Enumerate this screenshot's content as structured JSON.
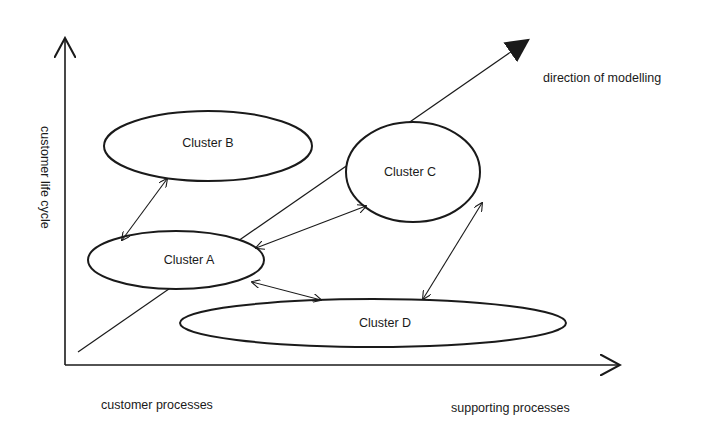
{
  "diagram": {
    "axes": {
      "y_label": "customer life cycle",
      "x_label_left": "customer processes",
      "x_label_right": "supporting processes"
    },
    "direction_label": "direction of modelling",
    "clusters": [
      {
        "id": "A",
        "label": "Cluster A"
      },
      {
        "id": "B",
        "label": "Cluster B"
      },
      {
        "id": "C",
        "label": "Cluster C"
      },
      {
        "id": "D",
        "label": "Cluster D"
      }
    ],
    "connections": [
      {
        "from": "A",
        "to": "B",
        "type": "bidirectional"
      },
      {
        "from": "A",
        "to": "C",
        "type": "bidirectional"
      },
      {
        "from": "A",
        "to": "D",
        "type": "bidirectional"
      },
      {
        "from": "C",
        "to": "D",
        "type": "bidirectional"
      }
    ],
    "colors": {
      "stroke": "#1a1a1a",
      "background": "#ffffff"
    }
  }
}
